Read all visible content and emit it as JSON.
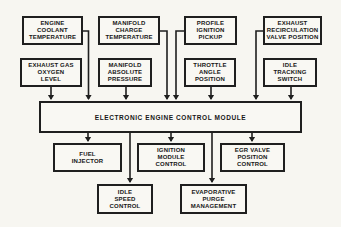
{
  "diagram": {
    "module": {
      "id": "electronic-engine-control-module",
      "label": "ELECTRONIC ENGINE CONTROL MODULE"
    },
    "inputs": [
      {
        "id": "engine-coolant-temperature",
        "label": "ENGINE\nCOOLANT\nTEMPERATURE"
      },
      {
        "id": "manifold-charge-temperature",
        "label": "MANIFOLD\nCHARGE\nTEMPERATURE"
      },
      {
        "id": "profile-ignition-pickup",
        "label": "PROFILE\nIGNITION\nPICKUP"
      },
      {
        "id": "exhaust-recirculation-valve-position",
        "label": "EXHAUST\nRECIRCULATION\nVALVE POSITION"
      },
      {
        "id": "exhaust-gas-oxygen-level",
        "label": "EXHAUST GAS\nOXYGEN\nLEVEL"
      },
      {
        "id": "manifold-absolute-pressure",
        "label": "MANIFOLD\nABSOLUTE\nPRESSURE"
      },
      {
        "id": "throttle-angle-position",
        "label": "THROTTLE\nANGLE\nPOSITION"
      },
      {
        "id": "idle-tracking-switch",
        "label": "IDLE\nTRACKING\nSWITCH"
      }
    ],
    "outputs": [
      {
        "id": "fuel-injector",
        "label": "FUEL\nINJECTOR"
      },
      {
        "id": "ignition-module-control",
        "label": "IGNITION\nMODULE\nCONTROL"
      },
      {
        "id": "egr-valve-position-control",
        "label": "EGR VALVE\nPOSITION\nCONTROL"
      },
      {
        "id": "idle-speed-control",
        "label": "IDLE\nSPEED\nCONTROL"
      },
      {
        "id": "evaporative-purge-management",
        "label": "EVAPORATIVE\nPURGE\nMANAGEMENT"
      }
    ],
    "connections": [
      {
        "from": "engine-coolant-temperature",
        "to": "electronic-engine-control-module"
      },
      {
        "from": "manifold-charge-temperature",
        "to": "electronic-engine-control-module"
      },
      {
        "from": "profile-ignition-pickup",
        "to": "electronic-engine-control-module"
      },
      {
        "from": "exhaust-recirculation-valve-position",
        "to": "electronic-engine-control-module"
      },
      {
        "from": "exhaust-gas-oxygen-level",
        "to": "electronic-engine-control-module"
      },
      {
        "from": "manifold-absolute-pressure",
        "to": "electronic-engine-control-module"
      },
      {
        "from": "throttle-angle-position",
        "to": "electronic-engine-control-module"
      },
      {
        "from": "idle-tracking-switch",
        "to": "electronic-engine-control-module"
      },
      {
        "from": "electronic-engine-control-module",
        "to": "fuel-injector"
      },
      {
        "from": "electronic-engine-control-module",
        "to": "idle-speed-control"
      },
      {
        "from": "electronic-engine-control-module",
        "to": "ignition-module-control"
      },
      {
        "from": "electronic-engine-control-module",
        "to": "evaporative-purge-management"
      },
      {
        "from": "electronic-engine-control-module",
        "to": "egr-valve-position-control"
      }
    ],
    "colors": {
      "line": "#1f1f1f",
      "background": "#f7f6f1",
      "box_border": "#1f1f1f"
    }
  }
}
